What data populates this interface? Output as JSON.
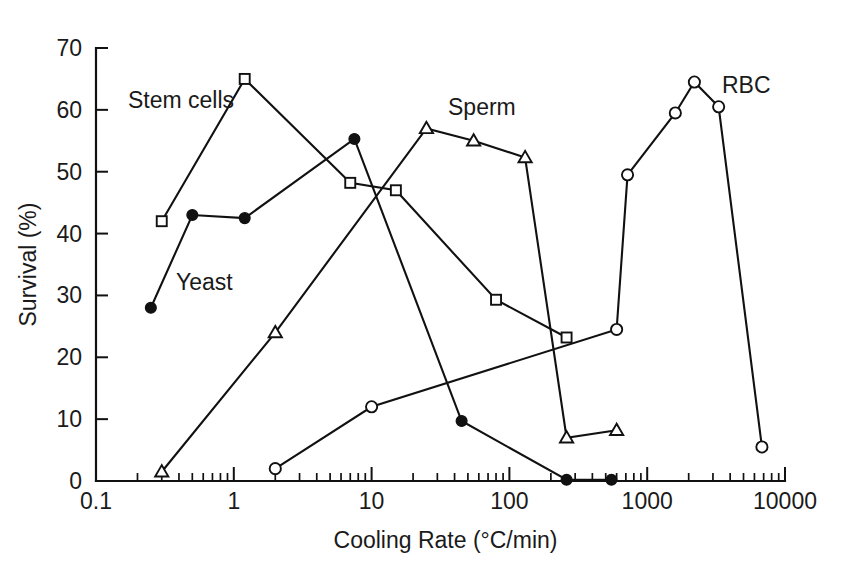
{
  "figure": {
    "title": "",
    "background": "#ffffff",
    "ink_color": "#111111"
  },
  "axes": {
    "x": {
      "label": "Cooling Rate (°C/min)",
      "scale": "log",
      "min": 0.1,
      "max": 10000,
      "tick_labels": [
        "0.1",
        "1",
        "10",
        "100",
        "1000",
        "10000"
      ],
      "tick_values": [
        0.1,
        1,
        10,
        100,
        1000,
        10000
      ]
    },
    "y": {
      "label": "Survival (%)",
      "scale": "linear",
      "min": 0,
      "max": 70,
      "tick_labels": [
        "0",
        "10",
        "20",
        "30",
        "40",
        "50",
        "60",
        "70"
      ],
      "tick_values": [
        0,
        10,
        20,
        30,
        40,
        50,
        60,
        70
      ]
    }
  },
  "annotations": [
    {
      "text": "Stem cells",
      "x_px": 128,
      "y_px": 108
    },
    {
      "text": "Yeast",
      "x_px": 176,
      "y_px": 290
    },
    {
      "text": "Sperm",
      "x_px": 448,
      "y_px": 115
    },
    {
      "text": "RBC",
      "x_px": 722,
      "y_px": 93
    }
  ],
  "chart_data": {
    "type": "line",
    "title": "",
    "xlabel": "Cooling Rate (°C/min)",
    "ylabel": "Survival (%)",
    "xscale": "log",
    "xlim": [
      0.1,
      10000
    ],
    "ylim": [
      0,
      70
    ],
    "grid": false,
    "legend": "inline annotations",
    "series": [
      {
        "name": "Stem cells",
        "marker": "open-square",
        "points": [
          {
            "x": 0.3,
            "y": 42.0
          },
          {
            "x": 1.2,
            "y": 65.0
          },
          {
            "x": 7.0,
            "y": 48.2
          },
          {
            "x": 15.0,
            "y": 47.0
          },
          {
            "x": 80.0,
            "y": 29.3
          },
          {
            "x": 260.0,
            "y": 23.2
          }
        ]
      },
      {
        "name": "Yeast",
        "marker": "filled-circle",
        "points": [
          {
            "x": 0.25,
            "y": 28.0
          },
          {
            "x": 0.5,
            "y": 43.0
          },
          {
            "x": 1.2,
            "y": 42.5
          },
          {
            "x": 7.5,
            "y": 55.3
          },
          {
            "x": 45.0,
            "y": 9.7
          },
          {
            "x": 260.0,
            "y": 0.2
          },
          {
            "x": 550.0,
            "y": 0.2
          }
        ]
      },
      {
        "name": "Sperm",
        "marker": "open-triangle",
        "points": [
          {
            "x": 0.3,
            "y": 1.5
          },
          {
            "x": 2.0,
            "y": 24.0
          },
          {
            "x": 25.0,
            "y": 57.0
          },
          {
            "x": 55.0,
            "y": 55.0
          },
          {
            "x": 130.0,
            "y": 52.3
          },
          {
            "x": 260.0,
            "y": 7.0
          },
          {
            "x": 600.0,
            "y": 8.2
          }
        ]
      },
      {
        "name": "RBC",
        "marker": "open-circle",
        "points": [
          {
            "x": 2.0,
            "y": 2.0
          },
          {
            "x": 10.0,
            "y": 12.0
          },
          {
            "x": 600.0,
            "y": 24.5
          },
          {
            "x": 720.0,
            "y": 49.5
          },
          {
            "x": 1600.0,
            "y": 59.5
          },
          {
            "x": 2200.0,
            "y": 64.5
          },
          {
            "x": 3300.0,
            "y": 60.5
          },
          {
            "x": 6800.0,
            "y": 5.5
          }
        ]
      }
    ]
  }
}
